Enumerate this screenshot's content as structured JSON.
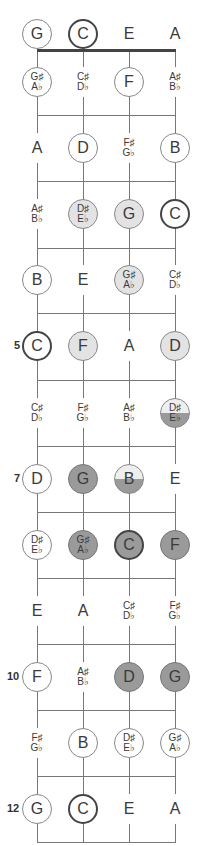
{
  "diagram": {
    "type": "ukulele-fretboard-note-map",
    "strings": [
      "G",
      "C",
      "E",
      "A"
    ],
    "string_x": [
      37,
      83,
      129,
      175
    ],
    "nut_y": 50,
    "fret_lines_y": [
      115,
      181,
      248,
      313,
      380,
      446,
      512,
      578,
      644,
      710,
      776,
      842
    ],
    "row_center_y": [
      34,
      82,
      148,
      214,
      280,
      346,
      413,
      479,
      545,
      611,
      677,
      743,
      809
    ],
    "fret_numbers": [
      {
        "fret": 5,
        "label": "5"
      },
      {
        "fret": 7,
        "label": "7"
      },
      {
        "fret": 10,
        "label": "10"
      },
      {
        "fret": 12,
        "label": "12"
      }
    ],
    "rows": [
      {
        "fret": 0,
        "notes": [
          {
            "label": "G",
            "style": "circle"
          },
          {
            "label": "C",
            "style": "bold"
          },
          {
            "label": "E",
            "style": "plain"
          },
          {
            "label": "A",
            "style": "plain"
          }
        ]
      },
      {
        "fret": 1,
        "notes": [
          {
            "label": "G♯",
            "label2": "A♭",
            "style": "circle"
          },
          {
            "label": "C♯",
            "label2": "D♭",
            "style": "plain"
          },
          {
            "label": "F",
            "style": "circle"
          },
          {
            "label": "A♯",
            "label2": "B♭",
            "style": "plain"
          }
        ]
      },
      {
        "fret": 2,
        "notes": [
          {
            "label": "A",
            "style": "plain"
          },
          {
            "label": "D",
            "style": "circle"
          },
          {
            "label": "F♯",
            "label2": "G♭",
            "style": "plain"
          },
          {
            "label": "B",
            "style": "circle"
          }
        ]
      },
      {
        "fret": 3,
        "notes": [
          {
            "label": "A♯",
            "label2": "B♭",
            "style": "plain"
          },
          {
            "label": "D♯",
            "label2": "E♭",
            "style": "light"
          },
          {
            "label": "G",
            "style": "light"
          },
          {
            "label": "C",
            "style": "bold"
          }
        ]
      },
      {
        "fret": 4,
        "notes": [
          {
            "label": "B",
            "style": "circle"
          },
          {
            "label": "E",
            "style": "plain"
          },
          {
            "label": "G♯",
            "label2": "A♭",
            "style": "light"
          },
          {
            "label": "C♯",
            "label2": "D♭",
            "style": "plain"
          }
        ]
      },
      {
        "fret": 5,
        "notes": [
          {
            "label": "C",
            "style": "bold"
          },
          {
            "label": "F",
            "style": "light"
          },
          {
            "label": "A",
            "style": "plain"
          },
          {
            "label": "D",
            "style": "light"
          }
        ]
      },
      {
        "fret": 6,
        "notes": [
          {
            "label": "C♯",
            "label2": "D♭",
            "style": "plain"
          },
          {
            "label": "F♯",
            "label2": "G♭",
            "style": "plain"
          },
          {
            "label": "A♯",
            "label2": "B♭",
            "style": "plain"
          },
          {
            "label": "D♯",
            "label2": "E♭",
            "style": "half"
          }
        ]
      },
      {
        "fret": 7,
        "notes": [
          {
            "label": "D",
            "style": "circle"
          },
          {
            "label": "G",
            "style": "dark"
          },
          {
            "label": "B",
            "style": "half"
          },
          {
            "label": "E",
            "style": "plain"
          }
        ]
      },
      {
        "fret": 8,
        "notes": [
          {
            "label": "D♯",
            "label2": "E♭",
            "style": "circle"
          },
          {
            "label": "G♯",
            "label2": "A♭",
            "style": "dark"
          },
          {
            "label": "C",
            "style": "dark-bold"
          },
          {
            "label": "F",
            "style": "dark"
          }
        ]
      },
      {
        "fret": 9,
        "notes": [
          {
            "label": "E",
            "style": "plain"
          },
          {
            "label": "A",
            "style": "plain"
          },
          {
            "label": "C♯",
            "label2": "D♭",
            "style": "plain"
          },
          {
            "label": "F♯",
            "label2": "G♭",
            "style": "plain"
          }
        ]
      },
      {
        "fret": 10,
        "notes": [
          {
            "label": "F",
            "style": "circle"
          },
          {
            "label": "A♯",
            "label2": "B♭",
            "style": "plain"
          },
          {
            "label": "D",
            "style": "dark"
          },
          {
            "label": "G",
            "style": "dark"
          }
        ]
      },
      {
        "fret": 11,
        "notes": [
          {
            "label": "F♯",
            "label2": "G♭",
            "style": "plain"
          },
          {
            "label": "B",
            "style": "circle"
          },
          {
            "label": "D♯",
            "label2": "E♭",
            "style": "circle"
          },
          {
            "label": "G♯",
            "label2": "A♭",
            "style": "circle"
          }
        ]
      },
      {
        "fret": 12,
        "notes": [
          {
            "label": "G",
            "style": "circle"
          },
          {
            "label": "C",
            "style": "bold"
          },
          {
            "label": "E",
            "style": "plain"
          },
          {
            "label": "A",
            "style": "plain"
          }
        ]
      }
    ]
  },
  "colors": {
    "line": "#777777",
    "nut": "#444444",
    "light_fill": "#e3e3e3",
    "dark_fill": "#9a9a9a",
    "text": "#3a3a3a"
  }
}
